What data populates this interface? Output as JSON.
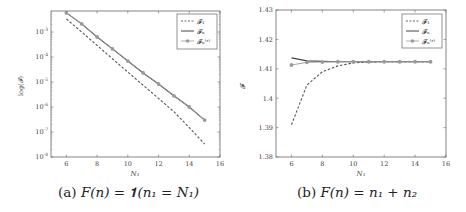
{
  "chart_data": [
    {
      "type": "line",
      "caption": "(a) F(n) = 1(n1 = N1)",
      "xlabel": "N1",
      "ylabel": "log(F)",
      "yscale": "log",
      "xlim": [
        5,
        16
      ],
      "ylim": [
        1e-08,
        0.0058
      ],
      "xticks": [
        6,
        8,
        10,
        12,
        14,
        16
      ],
      "yticks": [
        "10^-3",
        "10^-4",
        "10^-5",
        "10^-6",
        "10^-7",
        "10^-8"
      ],
      "legend_position": "upper right",
      "grid": false,
      "x": [
        6,
        7,
        8,
        9,
        10,
        11,
        12,
        13,
        14,
        15
      ],
      "series": [
        {
          "name": "F1",
          "style": "dashed",
          "color": "#555555",
          "values": [
            0.0033,
            0.001,
            0.00029,
            8.5e-05,
            2.5e-05,
            7.4e-06,
            2.2e-06,
            6.5e-07,
            1.5e-07,
            3.3e-08
          ]
        },
        {
          "name": "Fn",
          "style": "solid",
          "color": "#444444",
          "values": [
            0.0058,
            0.0021,
            0.00063,
            0.00021,
            6.9e-05,
            2.3e-05,
            8.3e-06,
            2.8e-06,
            1e-06,
            3e-07
          ]
        },
        {
          "name": "Fn^(e)",
          "style": "solid-marker",
          "color": "#9a9a9a",
          "values": [
            0.0058,
            0.0021,
            0.00063,
            0.00021,
            6.9e-05,
            2.3e-05,
            8.3e-06,
            2.8e-06,
            1e-06,
            3e-07
          ]
        }
      ]
    },
    {
      "type": "line",
      "caption": "(b) F(n) = n1 + n2",
      "xlabel": "N1",
      "ylabel": "F",
      "yscale": "linear",
      "xlim": [
        5,
        16
      ],
      "ylim": [
        1.38,
        1.43
      ],
      "xticks": [
        6,
        8,
        10,
        12,
        14,
        16
      ],
      "yticks": [
        1.38,
        1.39,
        1.4,
        1.41,
        1.42,
        1.43
      ],
      "legend_position": "upper right",
      "grid": false,
      "x": [
        6,
        7,
        8,
        9,
        10,
        11,
        12,
        13,
        14,
        15
      ],
      "series": [
        {
          "name": "F1",
          "style": "dashed",
          "color": "#555555",
          "values": [
            1.391,
            1.4045,
            1.409,
            1.411,
            1.412,
            1.4123,
            1.4124,
            1.4124,
            1.4124,
            1.4124
          ]
        },
        {
          "name": "Fn",
          "style": "solid",
          "color": "#444444",
          "values": [
            1.4137,
            1.4127,
            1.4125,
            1.4124,
            1.4124,
            1.4124,
            1.4124,
            1.4124,
            1.4124,
            1.4124
          ]
        },
        {
          "name": "Fn^(e)",
          "style": "solid-marker",
          "color": "#9a9a9a",
          "values": [
            1.4113,
            1.4122,
            1.4123,
            1.4124,
            1.4124,
            1.4124,
            1.4124,
            1.4124,
            1.4124,
            1.4124
          ]
        }
      ]
    }
  ],
  "figure": {
    "left": {
      "caption_prefix": "(a)",
      "caption_formula": "F(n) = 𝟏(n₁ = N₁)",
      "xlabel": "N₁",
      "ylabel": "log(𝓕)",
      "xtick_labels": [
        "6",
        "8",
        "10",
        "12",
        "14",
        "16"
      ],
      "legend": [
        "𝓕₁",
        "𝓕ₙ",
        "𝓕ₙ⁽ᵋ⁾"
      ]
    },
    "right": {
      "caption_prefix": "(b)",
      "caption_formula": "F(n) = n₁ + n₂",
      "xlabel": "N₁",
      "ylabel": "𝓕",
      "xtick_labels": [
        "6",
        "8",
        "10",
        "12",
        "14",
        "16"
      ],
      "ytick_labels": [
        "1.43",
        "1.42",
        "1.41",
        "1.4",
        "1.39",
        "1.38"
      ],
      "legend": [
        "𝓕₁",
        "𝓕ₙ",
        "𝓕ₙ⁽ᵋ⁾"
      ]
    }
  }
}
